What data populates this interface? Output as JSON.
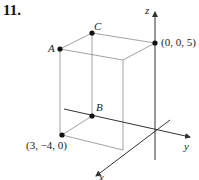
{
  "problem": {
    "number": "11."
  },
  "axes": {
    "x_label": "x",
    "y_label": "y",
    "z_label": "z"
  },
  "points": {
    "A": {
      "label": "A"
    },
    "B": {
      "label": "B"
    },
    "C": {
      "label": "C"
    },
    "top": {
      "label": "(0, 0, 5)"
    },
    "bottom": {
      "label": "(3, −4, 0)"
    }
  },
  "colors": {
    "line": "#555555",
    "axis": "#333333",
    "point": "#111111"
  }
}
